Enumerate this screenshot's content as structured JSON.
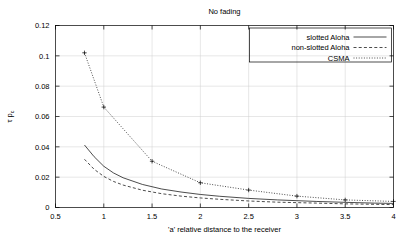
{
  "chart_data": {
    "type": "line",
    "title": "No fading",
    "xlabel": "'a' relative distance to the receiver",
    "ylabel": "τ p_c",
    "xlim": [
      0.5,
      4
    ],
    "ylim": [
      0,
      0.12
    ],
    "grid": true,
    "legend_position": "top-right",
    "xticks": [
      "0.5",
      "1",
      "1.5",
      "2",
      "2.5",
      "3",
      "3.5",
      "4"
    ],
    "xtick_values": [
      0.5,
      1,
      1.5,
      2,
      2.5,
      3,
      3.5,
      4
    ],
    "yticks": [
      "0",
      "0.02",
      "0.04",
      "0.06",
      "0.08",
      "0.1",
      "0.12"
    ],
    "ytick_values": [
      0,
      0.02,
      0.04,
      0.06,
      0.08,
      0.1,
      0.12
    ],
    "series": [
      {
        "name": "slotted Aloha",
        "style": "solid",
        "markers": false,
        "x": [
          0.8,
          0.9,
          1.0,
          1.1,
          1.2,
          1.4,
          1.6,
          1.8,
          2.0,
          2.2,
          2.5,
          2.8,
          3.0,
          3.2,
          3.5,
          3.8,
          4.0
        ],
        "y": [
          0.0412,
          0.0335,
          0.0272,
          0.0228,
          0.0196,
          0.0152,
          0.0122,
          0.0102,
          0.0086,
          0.0074,
          0.006,
          0.005,
          0.0045,
          0.004,
          0.0034,
          0.0029,
          0.0027
        ]
      },
      {
        "name": "non-slotted Aloha",
        "style": "dashed",
        "markers": false,
        "x": [
          0.8,
          0.9,
          1.0,
          1.1,
          1.2,
          1.4,
          1.6,
          1.8,
          2.0,
          2.2,
          2.5,
          2.8,
          3.0,
          3.2,
          3.5,
          3.8,
          4.0
        ],
        "y": [
          0.0318,
          0.0252,
          0.0205,
          0.0172,
          0.0148,
          0.0114,
          0.0091,
          0.0075,
          0.0063,
          0.0054,
          0.0043,
          0.0035,
          0.0032,
          0.0029,
          0.0024,
          0.0021,
          0.0019
        ]
      },
      {
        "name": "CSMA",
        "style": "dotted",
        "markers": true,
        "x": [
          0.8,
          1.0,
          1.5,
          2.0,
          2.5,
          3.0,
          3.5,
          4.0
        ],
        "y": [
          0.102,
          0.0662,
          0.0305,
          0.0163,
          0.0115,
          0.0075,
          0.005,
          0.004
        ]
      }
    ]
  },
  "legend": {
    "items": [
      {
        "label": "slotted Aloha",
        "style": "solid"
      },
      {
        "label": "non-slotted Aloha",
        "style": "dashed"
      },
      {
        "label": "CSMA",
        "style": "dotted"
      }
    ]
  }
}
